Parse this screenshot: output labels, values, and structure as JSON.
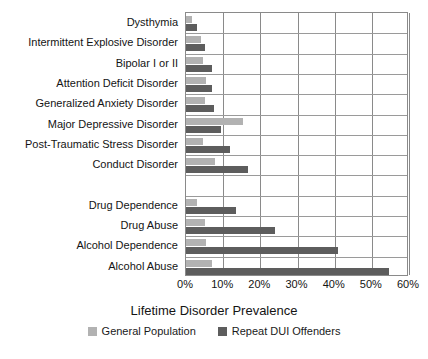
{
  "chart_data": {
    "type": "bar",
    "orientation": "horizontal",
    "title": "",
    "xlabel": "Lifetime Disorder Prevalence",
    "ylabel": "",
    "xlim": [
      0,
      60
    ],
    "xtick_labels": [
      "0%",
      "10%",
      "20%",
      "30%",
      "40%",
      "50%",
      "60%"
    ],
    "xtick_values": [
      0,
      10,
      20,
      30,
      40,
      50,
      60
    ],
    "grid": true,
    "legend_position": "bottom",
    "categories": [
      "Dysthymia",
      "Intermittent Explosive Disorder",
      "Bipolar I or II",
      "Attention Deficit Disorder",
      "Generalized Anxiety Disorder",
      "Major Depressive Disorder",
      "Post-Traumatic Stress Disorder",
      "Conduct Disorder",
      "",
      "Drug Dependence",
      "Drug Abuse",
      "Alcohol Dependence",
      "Alcohol Abuse"
    ],
    "series": [
      {
        "name": "General Population",
        "color": "#b2b2b2",
        "values": [
          1.6,
          4.0,
          4.5,
          5.4,
          5.2,
          15.3,
          4.5,
          7.8,
          null,
          3.0,
          5.0,
          5.5,
          7.0
        ]
      },
      {
        "name": "Repeat DUI Offenders",
        "color": "#5d5d5d",
        "values": [
          3.0,
          5.2,
          7.0,
          7.0,
          7.5,
          9.4,
          11.8,
          16.7,
          null,
          13.4,
          24.0,
          41.0,
          54.5
        ]
      }
    ]
  },
  "legend": {
    "items": [
      {
        "label": "General Population",
        "color": "#b2b2b2"
      },
      {
        "label": "Repeat DUI Offenders",
        "color": "#5d5d5d"
      }
    ]
  }
}
